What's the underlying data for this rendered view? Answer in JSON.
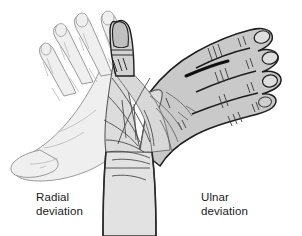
{
  "figure": {
    "width": 302,
    "height": 236,
    "background_color": "#ffffff"
  },
  "captions": {
    "left": {
      "line1": "Radial",
      "line2": "deviation",
      "full": "Radial\ndeviation",
      "color": "#1b1b1b"
    },
    "right": {
      "line1": "Ulnar",
      "line2": "deviation",
      "full": "Ulnar\ndeviation",
      "color": "#1b1b1b"
    }
  },
  "illustration": {
    "subject": "human right hand and forearm, dorsal view, shown in three wrist positions",
    "hands": [
      {
        "name": "radial-deviated-hand",
        "position": "left",
        "label": "Radial deviation",
        "fill_color": "#efefef",
        "outline_color": "#8a8a8a",
        "shading": "lightest, ghosted outline drawing",
        "fingers": 4,
        "thumb_direction": "pointing left and down"
      },
      {
        "name": "neutral-hand",
        "position": "center",
        "label": "Neutral",
        "fill_color": "#dcdcdc",
        "outline_color": "#5a5a5a",
        "shading": "mid gray with palm and wrist creases",
        "fingers": 0,
        "thumb_direction": "pointing up"
      },
      {
        "name": "ulnar-deviated-hand",
        "position": "right",
        "label": "Ulnar deviation",
        "fill_color": "#c9c9c9",
        "outline_color": "#1e1e1e",
        "shading": "darkest, bold outline drawing",
        "fingers": 4,
        "thumb_direction": "tucked toward center"
      }
    ],
    "forearm": {
      "name": "forearm",
      "fill_color": "#e0e0e0",
      "outline_color": "#3a3a3a",
      "note": "vertical forearm extending to the bottom edge of the figure"
    },
    "colors": {
      "background": "#ffffff",
      "light_fill": "#efefef",
      "mid_fill": "#dcdcdc",
      "dark_fill": "#c9c9c9",
      "light_line": "#9a9a9a",
      "mid_line": "#5a5a5a",
      "dark_line": "#1e1e1e",
      "text": "#1b1b1b"
    }
  }
}
